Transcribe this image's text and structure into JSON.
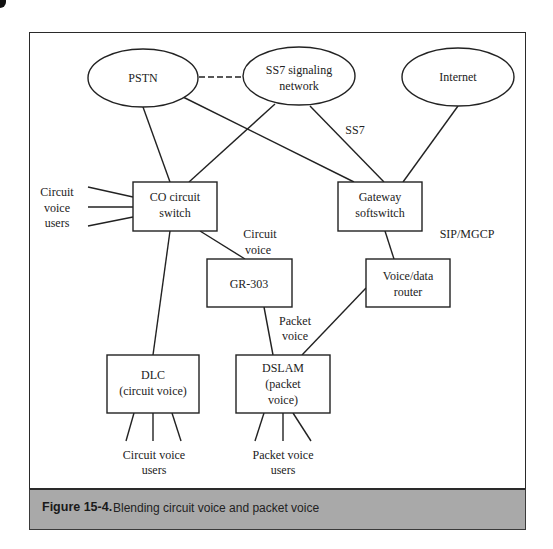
{
  "figure": {
    "number": "Figure 15-4.",
    "caption": "Blending circuit voice and packet voice",
    "colors": {
      "line": "#222222",
      "caption_band": "#a9a9a9",
      "background": "#ffffff"
    }
  },
  "nodes": {
    "pstn": {
      "label": "PSTN",
      "shape": "ellipse"
    },
    "ss7": {
      "label_line1": "SS7 signaling",
      "label_line2": "network",
      "shape": "ellipse"
    },
    "internet": {
      "label": "Internet",
      "shape": "ellipse"
    },
    "co_switch": {
      "label_line1": "CO circuit",
      "label_line2": "switch",
      "shape": "box"
    },
    "gateway": {
      "label_line1": "Gateway",
      "label_line2": "softswitch",
      "shape": "box"
    },
    "gr303": {
      "label": "GR-303",
      "shape": "box"
    },
    "router": {
      "label_line1": "Voice/data",
      "label_line2": "router",
      "shape": "box"
    },
    "dlc": {
      "label_line1": "DLC",
      "label_line2": "(circuit voice)",
      "shape": "box"
    },
    "dslam": {
      "label_line1": "DSLAM",
      "label_line2": "(packet",
      "label_line3": "voice)",
      "shape": "box"
    }
  },
  "annotations": {
    "circuit_users_left": {
      "line1": "Circuit",
      "line2": "voice",
      "line3": "users"
    },
    "ss7_link": "SS7",
    "sip_mgcp": "SIP/MGCP",
    "circuit_voice": {
      "line1": "Circuit",
      "line2": "voice"
    },
    "packet_voice": {
      "line1": "Packet",
      "line2": "voice"
    },
    "circuit_users_bottom": {
      "line1": "Circuit voice",
      "line2": "users"
    },
    "packet_users_bottom": {
      "line1": "Packet voice",
      "line2": "users"
    }
  },
  "edges": [
    {
      "from": "PSTN",
      "to": "SS7 signaling network",
      "style": "dashed"
    },
    {
      "from": "PSTN",
      "to": "CO circuit switch",
      "style": "solid"
    },
    {
      "from": "PSTN",
      "to": "Gateway softswitch",
      "style": "solid"
    },
    {
      "from": "SS7 signaling network",
      "to": "CO circuit switch",
      "style": "solid"
    },
    {
      "from": "SS7 signaling network",
      "to": "Gateway softswitch",
      "style": "solid",
      "label": "SS7"
    },
    {
      "from": "Internet",
      "to": "Gateway softswitch",
      "style": "solid"
    },
    {
      "from": "CO circuit switch",
      "to": "GR-303",
      "style": "solid",
      "label": "Circuit voice"
    },
    {
      "from": "CO circuit switch",
      "to": "DLC",
      "style": "solid"
    },
    {
      "from": "Gateway softswitch",
      "to": "Voice/data router",
      "style": "solid",
      "label": "SIP/MGCP"
    },
    {
      "from": "GR-303",
      "to": "DSLAM",
      "style": "solid",
      "label": "Packet voice"
    },
    {
      "from": "Voice/data router",
      "to": "DSLAM",
      "style": "solid"
    }
  ]
}
